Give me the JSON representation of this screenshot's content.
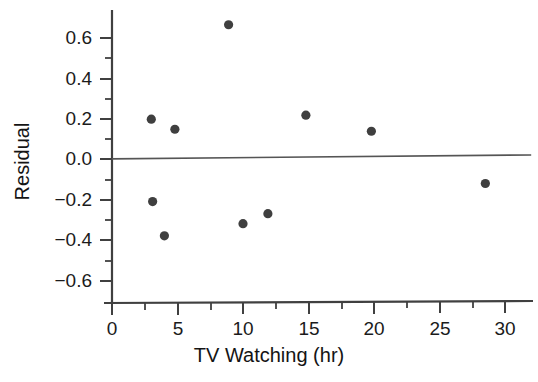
{
  "chart_data": {
    "type": "scatter",
    "title": "",
    "xlabel": "TV Watching (hr)",
    "ylabel": "Residual",
    "xlim": [
      0,
      32
    ],
    "ylim": [
      -0.7,
      0.72
    ],
    "grid": false,
    "legend": null,
    "x_ticks": [
      0,
      5,
      10,
      15,
      20,
      25,
      30
    ],
    "x_tick_labels": [
      "0",
      "5",
      "10",
      "15",
      "20",
      "25",
      "30"
    ],
    "x_minor_ticks": [
      2.5,
      7.5,
      12.5,
      17.5,
      22.5,
      27.5
    ],
    "y_ticks": [
      -0.6,
      -0.4,
      -0.2,
      0.0,
      0.2,
      0.4,
      0.6
    ],
    "y_tick_labels": [
      "−0.6",
      "−0.4",
      "−0.2",
      "0.0",
      "0.2",
      "0.4",
      "0.6"
    ],
    "y_minor_ticks": [
      -0.5,
      -0.3,
      -0.1,
      0.1,
      0.3,
      0.5
    ],
    "x": [
      3.0,
      3.1,
      4.0,
      4.8,
      8.9,
      10.0,
      11.9,
      14.8,
      19.8,
      28.5
    ],
    "y": [
      0.2,
      -0.21,
      -0.38,
      0.15,
      0.67,
      -0.32,
      -0.27,
      0.22,
      0.14,
      -0.12
    ],
    "points": [
      {
        "x": 3.0,
        "y": 0.2
      },
      {
        "x": 3.1,
        "y": -0.21
      },
      {
        "x": 4.0,
        "y": -0.38
      },
      {
        "x": 4.8,
        "y": 0.15
      },
      {
        "x": 8.9,
        "y": 0.67
      },
      {
        "x": 10.0,
        "y": -0.32
      },
      {
        "x": 11.9,
        "y": -0.27
      },
      {
        "x": 14.8,
        "y": 0.22
      },
      {
        "x": 19.8,
        "y": 0.14
      },
      {
        "x": 28.5,
        "y": -0.12
      }
    ],
    "reference_line": {
      "name": "zero-residual-line",
      "y_at_xmin": 0.003,
      "y_at_xmax": 0.022
    },
    "marker": {
      "shape": "circle",
      "color": "#3f3f3f",
      "size_px": 4.6
    },
    "axis_color": "#404040",
    "text_color": "#1b1b1b"
  }
}
